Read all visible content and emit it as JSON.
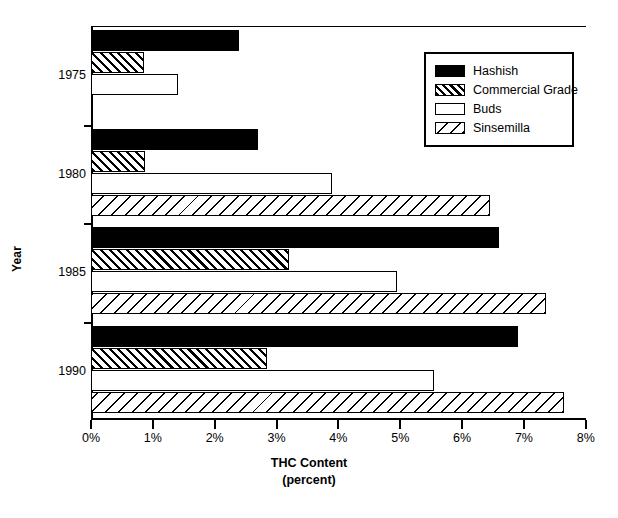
{
  "chart_data": {
    "type": "bar",
    "orientation": "horizontal",
    "title": "",
    "xlabel": "THC Content",
    "xlabel_line2": "(percent)",
    "ylabel": "Year",
    "categories": [
      "1975",
      "1980",
      "1985",
      "1990"
    ],
    "xlim": [
      0,
      8
    ],
    "xtick_labels": [
      "0%",
      "1%",
      "2%",
      "3%",
      "4%",
      "5%",
      "6%",
      "7%",
      "8%"
    ],
    "xtick_values": [
      0,
      1,
      2,
      3,
      4,
      5,
      6,
      7,
      8
    ],
    "grid": false,
    "legend_position": "top-right",
    "series": [
      {
        "name": "Hashish",
        "fill": "solid-black",
        "values": [
          2.4,
          2.7,
          6.6,
          6.9
        ]
      },
      {
        "name": "Commercial Grade",
        "fill": "dense-forward-hatch",
        "values": [
          0.85,
          0.88,
          3.2,
          2.85
        ]
      },
      {
        "name": "Buds",
        "fill": "white",
        "values": [
          1.4,
          3.9,
          4.95,
          5.55
        ]
      },
      {
        "name": "Sinsemilla",
        "fill": "sparse-back-hatch",
        "values": [
          null,
          6.45,
          7.35,
          7.65
        ]
      }
    ]
  },
  "legend": {
    "items": [
      {
        "label": "Hashish",
        "swatch": "solid-black-swatch"
      },
      {
        "label": "Commercial Grade",
        "swatch": "hatch-forward-swatch"
      },
      {
        "label": "Buds",
        "swatch": "white-swatch"
      },
      {
        "label": "Sinsemilla",
        "swatch": "hatch-back-swatch"
      }
    ]
  },
  "axes": {
    "y_title": "Year",
    "x_title": "THC Content",
    "x_title_sub": "(percent)"
  },
  "colors": {
    "ink": "#000000",
    "background": "#ffffff"
  }
}
